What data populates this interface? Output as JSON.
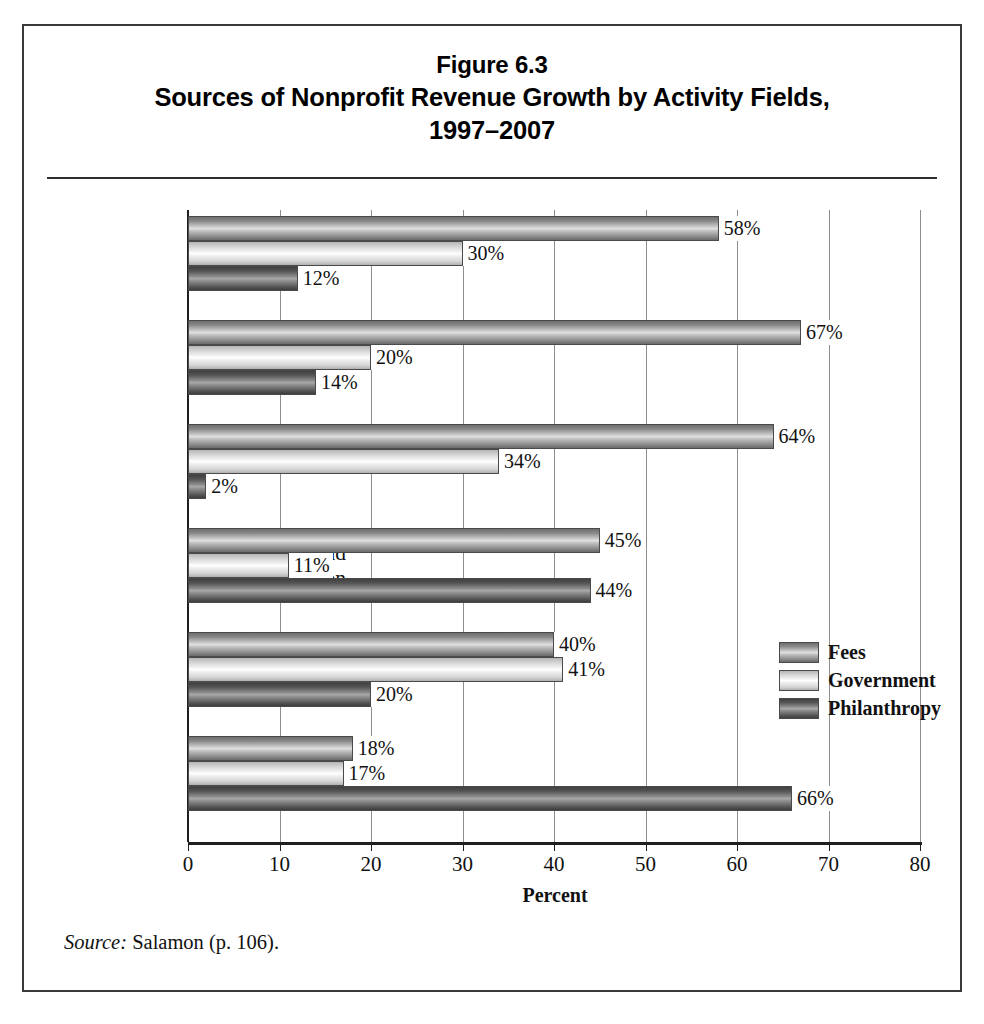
{
  "figure": {
    "title_line1": "Figure 6.3",
    "title_line2": "Sources of Nonprofit Revenue Growth by Activity Fields,",
    "title_line3": "1997–2007",
    "source_label": "Source:",
    "source_text": " Salamon (p. 106)."
  },
  "legend": {
    "position": "inside-right",
    "items": [
      {
        "label": "Fees",
        "color": "#b0b0b0"
      },
      {
        "label": "Government",
        "color": "#ededed"
      },
      {
        "label": "Philanthropy",
        "color": "#6e6e6e"
      }
    ]
  },
  "axis": {
    "x_title": "Percent",
    "ticks": [
      "0",
      "10",
      "20",
      "30",
      "40",
      "50",
      "60",
      "70",
      "80"
    ]
  },
  "chart_data": {
    "type": "bar",
    "orientation": "horizontal",
    "xlabel": "Percent",
    "ylabel": "",
    "xlim": [
      0,
      80
    ],
    "xticks": [
      0,
      10,
      20,
      30,
      40,
      50,
      60,
      70,
      80
    ],
    "grid": true,
    "grid_axis": "x",
    "legend": [
      "Fees",
      "Government",
      "Philanthropy"
    ],
    "legend_position": "inside-right",
    "categories": [
      "Total",
      "Education and Research",
      "Health",
      "Culture and Recreation",
      "Social Services",
      "Environment"
    ],
    "series": [
      {
        "name": "Fees",
        "values": [
          58,
          67,
          64,
          45,
          40,
          18
        ]
      },
      {
        "name": "Government",
        "values": [
          30,
          20,
          34,
          11,
          41,
          17
        ]
      },
      {
        "name": "Philanthropy",
        "values": [
          12,
          14,
          2,
          44,
          20,
          66
        ]
      }
    ],
    "data_labels": [
      [
        "58%",
        "30%",
        "12%"
      ],
      [
        "67%",
        "20%",
        "14%"
      ],
      [
        "64%",
        "34%",
        "2%"
      ],
      [
        "45%",
        "11%",
        "44%"
      ],
      [
        "40%",
        "41%",
        "20%"
      ],
      [
        "18%",
        "17%",
        "66%"
      ]
    ]
  },
  "category_labels": [
    [
      "Total"
    ],
    [
      "Education",
      "and Research"
    ],
    [
      "Health"
    ],
    [
      "Culture and",
      "Recreation"
    ],
    [
      "Social",
      "Services"
    ],
    [
      "Environment"
    ]
  ]
}
